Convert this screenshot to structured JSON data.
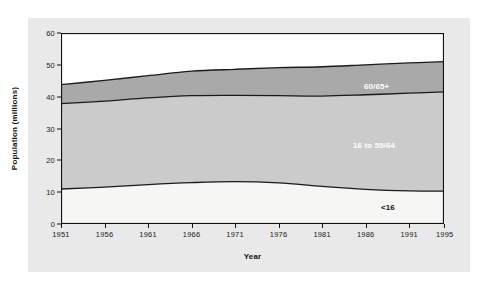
{
  "chart_data": {
    "type": "area",
    "stacked": true,
    "title": "",
    "xlabel": "Year",
    "ylabel": "Population (millions)",
    "xlim": [
      1951,
      1995
    ],
    "ylim": [
      0,
      60
    ],
    "yticks": [
      0,
      10,
      20,
      30,
      40,
      50,
      60
    ],
    "xticks": [
      1951,
      1956,
      1961,
      1966,
      1971,
      1976,
      1981,
      1986,
      1991,
      1995
    ],
    "grid": false,
    "legend": "inline-band-labels",
    "x": [
      1951,
      1956,
      1961,
      1966,
      1971,
      1976,
      1981,
      1986,
      1991,
      1995
    ],
    "series": [
      {
        "name": "<16",
        "label": "<16",
        "color": "#f6f6f4",
        "label_color": "#111111",
        "values": [
          11.0,
          11.6,
          12.4,
          13.0,
          13.3,
          12.9,
          11.8,
          10.9,
          10.4,
          10.3
        ]
      },
      {
        "name": "16 to 59/64",
        "label": "16 to 59/64",
        "color": "#cbcbcb",
        "label_color": "#ffffff",
        "values": [
          26.8,
          27.0,
          27.2,
          27.3,
          27.1,
          27.4,
          28.4,
          29.7,
          30.7,
          31.2
        ]
      },
      {
        "name": "60/65+",
        "label": "60/65+",
        "color": "#a9a9a9",
        "label_color": "#ffffff",
        "values": [
          6.0,
          6.5,
          7.0,
          7.7,
          8.2,
          8.8,
          9.2,
          9.4,
          9.5,
          9.5
        ]
      }
    ],
    "cumulative": {
      "lower": [
        11.0,
        11.6,
        12.4,
        13.0,
        13.3,
        12.9,
        11.8,
        10.9,
        10.4,
        10.3
      ],
      "middle": [
        37.8,
        38.6,
        39.6,
        40.3,
        40.4,
        40.3,
        40.2,
        40.6,
        41.1,
        41.5
      ],
      "upper": [
        43.8,
        45.1,
        46.6,
        48.0,
        48.6,
        49.1,
        49.4,
        50.0,
        50.6,
        51.0
      ]
    }
  },
  "figure": {
    "background": "#e9e9e9",
    "plot_background": "#ffffff",
    "axis_color": "#111111"
  }
}
